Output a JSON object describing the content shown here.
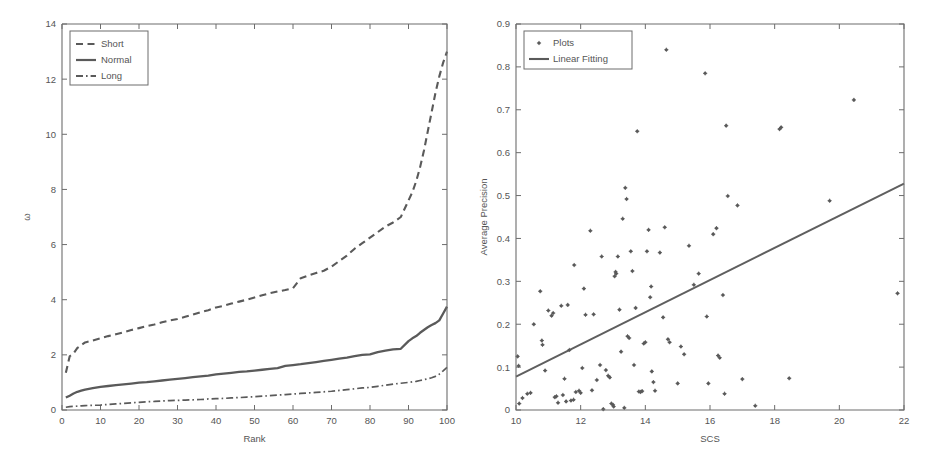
{
  "figure": {
    "panels": [
      "rank-omega-curves",
      "scs-average-precision-scatter"
    ]
  },
  "chart_data": [
    {
      "type": "line",
      "title": "",
      "xlabel": "Rank",
      "ylabel": "ω",
      "xlim": [
        0,
        100
      ],
      "ylim": [
        0,
        14
      ],
      "xticks": [
        0,
        10,
        20,
        30,
        40,
        50,
        60,
        70,
        80,
        90,
        100
      ],
      "yticks": [
        0,
        2,
        4,
        6,
        8,
        10,
        12,
        14
      ],
      "grid": false,
      "legend_position": "top-left",
      "legend": [
        "Short",
        "Normal",
        "Long"
      ],
      "x": [
        1,
        2,
        3,
        4,
        5,
        6,
        8,
        10,
        12,
        14,
        16,
        18,
        20,
        22,
        24,
        26,
        28,
        30,
        32,
        34,
        36,
        38,
        40,
        42,
        44,
        46,
        48,
        50,
        52,
        54,
        56,
        58,
        60,
        62,
        64,
        66,
        68,
        70,
        72,
        74,
        76,
        78,
        80,
        82,
        84,
        86,
        88,
        90,
        91,
        92,
        93,
        94,
        95,
        96,
        97,
        98,
        99,
        100
      ],
      "series": [
        {
          "name": "Short",
          "style": "dashed",
          "values": [
            1.35,
            1.95,
            2.05,
            2.25,
            2.35,
            2.45,
            2.52,
            2.6,
            2.68,
            2.75,
            2.82,
            2.9,
            2.97,
            3.04,
            3.1,
            3.18,
            3.25,
            3.3,
            3.38,
            3.46,
            3.55,
            3.62,
            3.72,
            3.78,
            3.86,
            3.93,
            4.0,
            4.08,
            4.16,
            4.24,
            4.3,
            4.35,
            4.42,
            4.78,
            4.88,
            4.97,
            5.05,
            5.2,
            5.4,
            5.6,
            5.85,
            6.05,
            6.25,
            6.45,
            6.65,
            6.8,
            7.0,
            7.6,
            7.9,
            8.3,
            8.8,
            9.4,
            10.1,
            10.8,
            11.5,
            12.1,
            12.6,
            13.0
          ]
        },
        {
          "name": "Normal",
          "style": "solid",
          "values": [
            0.45,
            0.52,
            0.6,
            0.66,
            0.7,
            0.74,
            0.79,
            0.84,
            0.87,
            0.9,
            0.93,
            0.96,
            0.99,
            1.01,
            1.04,
            1.07,
            1.1,
            1.13,
            1.16,
            1.19,
            1.22,
            1.25,
            1.29,
            1.32,
            1.35,
            1.38,
            1.4,
            1.43,
            1.46,
            1.49,
            1.52,
            1.6,
            1.63,
            1.66,
            1.7,
            1.74,
            1.78,
            1.82,
            1.86,
            1.9,
            1.95,
            2.0,
            2.02,
            2.1,
            2.15,
            2.2,
            2.22,
            2.5,
            2.6,
            2.68,
            2.8,
            2.9,
            3.0,
            3.08,
            3.15,
            3.25,
            3.5,
            3.75
          ]
        },
        {
          "name": "Long",
          "style": "dash-dot",
          "values": [
            0.1,
            0.12,
            0.13,
            0.14,
            0.15,
            0.16,
            0.17,
            0.18,
            0.2,
            0.22,
            0.24,
            0.26,
            0.28,
            0.3,
            0.31,
            0.33,
            0.34,
            0.35,
            0.36,
            0.37,
            0.38,
            0.4,
            0.41,
            0.42,
            0.44,
            0.45,
            0.47,
            0.48,
            0.5,
            0.52,
            0.54,
            0.56,
            0.58,
            0.6,
            0.62,
            0.64,
            0.66,
            0.68,
            0.71,
            0.74,
            0.77,
            0.8,
            0.82,
            0.86,
            0.9,
            0.94,
            0.97,
            1.0,
            1.02,
            1.04,
            1.07,
            1.1,
            1.13,
            1.17,
            1.22,
            1.3,
            1.42,
            1.55
          ]
        }
      ]
    },
    {
      "type": "scatter",
      "title": "",
      "xlabel": "SCS",
      "ylabel": "Average Precision",
      "xlim": [
        10,
        22
      ],
      "ylim": [
        0,
        0.9
      ],
      "xticks": [
        10,
        12,
        14,
        16,
        18,
        20,
        22
      ],
      "yticks": [
        0,
        0.1,
        0.2,
        0.3,
        0.4,
        0.5,
        0.6,
        0.7,
        0.8,
        0.9
      ],
      "grid": false,
      "legend_position": "top-left",
      "legend": [
        "Plots",
        "Linear Fitting"
      ],
      "fit_line": {
        "name": "Linear Fitting",
        "x": [
          10.0,
          22.0
        ],
        "y": [
          0.078,
          0.528
        ],
        "slope": 0.0375,
        "intercept": -0.297
      },
      "points": [
        [
          10.05,
          0.125
        ],
        [
          10.08,
          0.103
        ],
        [
          10.1,
          0.015
        ],
        [
          10.2,
          0.028
        ],
        [
          10.35,
          0.038
        ],
        [
          10.45,
          0.04
        ],
        [
          10.55,
          0.2
        ],
        [
          10.75,
          0.277
        ],
        [
          10.8,
          0.162
        ],
        [
          10.82,
          0.152
        ],
        [
          10.9,
          0.092
        ],
        [
          11.0,
          0.232
        ],
        [
          11.1,
          0.22
        ],
        [
          11.15,
          0.226
        ],
        [
          11.2,
          0.03
        ],
        [
          11.25,
          0.032
        ],
        [
          11.3,
          0.017
        ],
        [
          11.4,
          0.243
        ],
        [
          11.45,
          0.035
        ],
        [
          11.5,
          0.073
        ],
        [
          11.55,
          0.02
        ],
        [
          11.6,
          0.245
        ],
        [
          11.65,
          0.14
        ],
        [
          11.7,
          0.022
        ],
        [
          11.78,
          0.024
        ],
        [
          11.8,
          0.338
        ],
        [
          11.85,
          0.042
        ],
        [
          11.95,
          0.045
        ],
        [
          12.0,
          0.04
        ],
        [
          12.05,
          0.098
        ],
        [
          12.1,
          0.283
        ],
        [
          12.15,
          0.222
        ],
        [
          12.3,
          0.418
        ],
        [
          12.35,
          0.046
        ],
        [
          12.4,
          0.223
        ],
        [
          12.5,
          0.07
        ],
        [
          12.6,
          0.105
        ],
        [
          12.65,
          0.358
        ],
        [
          12.7,
          0.002
        ],
        [
          12.78,
          0.093
        ],
        [
          12.85,
          0.08
        ],
        [
          12.9,
          0.076
        ],
        [
          12.95,
          0.015
        ],
        [
          13.0,
          0.012
        ],
        [
          13.02,
          0.008
        ],
        [
          13.05,
          0.312
        ],
        [
          13.08,
          0.322
        ],
        [
          13.1,
          0.318
        ],
        [
          13.15,
          0.358
        ],
        [
          13.2,
          0.234
        ],
        [
          13.25,
          0.136
        ],
        [
          13.3,
          0.446
        ],
        [
          13.35,
          0.005
        ],
        [
          13.38,
          0.518
        ],
        [
          13.42,
          0.492
        ],
        [
          13.45,
          0.172
        ],
        [
          13.5,
          0.168
        ],
        [
          13.55,
          0.37
        ],
        [
          13.6,
          0.324
        ],
        [
          13.65,
          0.105
        ],
        [
          13.7,
          0.238
        ],
        [
          13.75,
          0.65
        ],
        [
          13.8,
          0.043
        ],
        [
          13.85,
          0.042
        ],
        [
          13.9,
          0.044
        ],
        [
          13.95,
          0.155
        ],
        [
          14.0,
          0.158
        ],
        [
          14.05,
          0.37
        ],
        [
          14.1,
          0.42
        ],
        [
          14.15,
          0.263
        ],
        [
          14.18,
          0.288
        ],
        [
          14.2,
          0.09
        ],
        [
          14.25,
          0.065
        ],
        [
          14.3,
          0.045
        ],
        [
          14.45,
          0.367
        ],
        [
          14.55,
          0.216
        ],
        [
          14.6,
          0.426
        ],
        [
          14.65,
          0.84
        ],
        [
          14.7,
          0.165
        ],
        [
          14.75,
          0.158
        ],
        [
          15.0,
          0.062
        ],
        [
          15.1,
          0.148
        ],
        [
          15.2,
          0.13
        ],
        [
          15.35,
          0.383
        ],
        [
          15.5,
          0.292
        ],
        [
          15.65,
          0.318
        ],
        [
          15.85,
          0.785
        ],
        [
          15.9,
          0.218
        ],
        [
          15.95,
          0.062
        ],
        [
          16.1,
          0.41
        ],
        [
          16.2,
          0.424
        ],
        [
          16.25,
          0.127
        ],
        [
          16.3,
          0.122
        ],
        [
          16.4,
          0.268
        ],
        [
          16.45,
          0.038
        ],
        [
          16.5,
          0.663
        ],
        [
          16.55,
          0.499
        ],
        [
          16.85,
          0.477
        ],
        [
          17.0,
          0.072
        ],
        [
          17.4,
          0.01
        ],
        [
          18.15,
          0.655
        ],
        [
          18.2,
          0.659
        ],
        [
          18.45,
          0.074
        ],
        [
          19.7,
          0.488
        ],
        [
          20.45,
          0.723
        ],
        [
          21.8,
          0.272
        ]
      ]
    }
  ]
}
